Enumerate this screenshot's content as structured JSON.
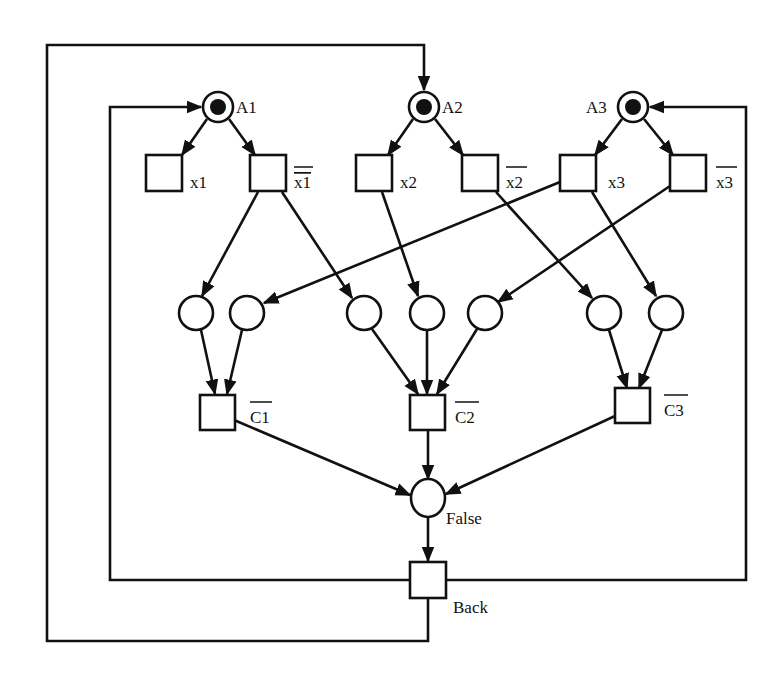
{
  "diagram": {
    "type": "petri-net",
    "colors": {
      "stroke": "#111111",
      "background": "#ffffff",
      "token": "#111111"
    },
    "places": {
      "A1": {
        "label": "A1",
        "marked": true
      },
      "A2": {
        "label": "A2",
        "marked": true
      },
      "A3": {
        "label": "A3",
        "marked": true
      },
      "False": {
        "label": "False",
        "marked": false
      }
    },
    "transitions": {
      "x1": {
        "label": "x1",
        "negated": false
      },
      "nx1": {
        "label": "x1",
        "negated": true
      },
      "x2": {
        "label": "x2",
        "negated": false
      },
      "nx2": {
        "label": "x2",
        "negated": true
      },
      "x3": {
        "label": "x3",
        "negated": false
      },
      "nx3": {
        "label": "x3",
        "negated": true
      },
      "nC1": {
        "label": "C1",
        "negated": true
      },
      "nC2": {
        "label": "C2",
        "negated": true
      },
      "nC3": {
        "label": "C3",
        "negated": true
      },
      "Back": {
        "label": "Back",
        "negated": false
      }
    },
    "intermediate_places_count": 7,
    "arcs": [
      "A1->x1",
      "A1->nx1",
      "A2->x2",
      "A2->nx2",
      "A3->x3",
      "A3->nx3",
      "nx1->p1",
      "nx1->p3",
      "x3->p2",
      "x2->p4",
      "nx3->p5",
      "nx2->p6",
      "x3->p7",
      "p1->nC1",
      "p2->nC1",
      "p3->nC2",
      "p4->nC2",
      "p5->nC2",
      "p6->nC3",
      "p7->nC3",
      "nC1->False",
      "nC2->False",
      "nC3->False",
      "False->Back",
      "Back->A1",
      "Back->A2",
      "Back->A3"
    ]
  }
}
